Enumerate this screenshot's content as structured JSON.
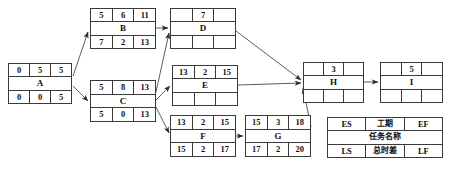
{
  "diagram": {
    "nodes": [
      {
        "id": "A",
        "name": "A",
        "es": "0",
        "duration": "5",
        "ef": "5",
        "ls": "0",
        "tf": "0",
        "lf": "5"
      },
      {
        "id": "B",
        "name": "B",
        "es": "5",
        "duration": "6",
        "ef": "11",
        "ls": "7",
        "tf": "2",
        "lf": "13"
      },
      {
        "id": "C",
        "name": "C",
        "es": "5",
        "duration": "8",
        "ef": "13",
        "ls": "5",
        "tf": "0",
        "lf": "13"
      },
      {
        "id": "D",
        "name": "D",
        "es": "",
        "duration": "7",
        "ef": "",
        "ls": "",
        "tf": "",
        "lf": ""
      },
      {
        "id": "E",
        "name": "E",
        "es": "13",
        "duration": "2",
        "ef": "15",
        "ls": "",
        "tf": "",
        "lf": ""
      },
      {
        "id": "F",
        "name": "F",
        "es": "13",
        "duration": "2",
        "ef": "15",
        "ls": "15",
        "tf": "2",
        "lf": "17"
      },
      {
        "id": "G",
        "name": "G",
        "es": "15",
        "duration": "3",
        "ef": "18",
        "ls": "17",
        "tf": "2",
        "lf": "20"
      },
      {
        "id": "H",
        "name": "H",
        "es": "",
        "duration": "3",
        "ef": "",
        "ls": "",
        "tf": "",
        "lf": ""
      },
      {
        "id": "I",
        "name": "I",
        "es": "",
        "duration": "5",
        "ef": "",
        "ls": "",
        "tf": "",
        "lf": ""
      }
    ],
    "legend": {
      "es_label": "ES",
      "duration_label": "工期",
      "ef_label": "EF",
      "name_label": "任务名称",
      "ls_label": "LS",
      "tf_label": "总时差",
      "lf_label": "LF"
    },
    "edges": [
      {
        "from": "A",
        "to": "B"
      },
      {
        "from": "A",
        "to": "C"
      },
      {
        "from": "B",
        "to": "D"
      },
      {
        "from": "C",
        "to": "D"
      },
      {
        "from": "C",
        "to": "E"
      },
      {
        "from": "C",
        "to": "F"
      },
      {
        "from": "D",
        "to": "H"
      },
      {
        "from": "E",
        "to": "H"
      },
      {
        "from": "F",
        "to": "G"
      },
      {
        "from": "G",
        "to": "H"
      },
      {
        "from": "H",
        "to": "I"
      }
    ],
    "colors": {
      "line": "#3a3a3a",
      "text": "#101010",
      "background": "#ffffff"
    }
  }
}
